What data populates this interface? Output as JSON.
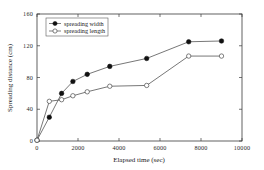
{
  "chart_data": {
    "type": "line",
    "title": "",
    "xlabel": "Elapsed time (sec)",
    "ylabel": "Spreading distance (cm)",
    "xlim": [
      0,
      10000
    ],
    "ylim": [
      0,
      160
    ],
    "xticks": [
      0,
      2000,
      4000,
      6000,
      8000,
      10000
    ],
    "yticks": [
      0,
      40,
      80,
      120,
      160
    ],
    "xtick_labels": [
      "0",
      "2000",
      "4000",
      "6000",
      "8000",
      "10000"
    ],
    "ytick_labels": [
      "0",
      "40",
      "80",
      "120",
      "160"
    ],
    "grid": false,
    "legend_position": "upper-left",
    "series": [
      {
        "name": "spreading width",
        "marker": "filled-circle",
        "x": [
          0,
          600,
          1200,
          1750,
          2450,
          3550,
          5350,
          7400,
          9000
        ],
        "values": [
          1,
          30,
          60,
          75,
          84,
          94,
          104,
          125,
          126
        ]
      },
      {
        "name": "spreading length",
        "marker": "open-circle",
        "x": [
          0,
          600,
          1200,
          1750,
          2450,
          3550,
          5350,
          7400,
          9000
        ],
        "values": [
          1,
          50,
          52,
          57,
          62,
          69,
          70,
          107,
          107
        ]
      }
    ]
  },
  "legend": {
    "entries": [
      {
        "label": "spreading width"
      },
      {
        "label": "spreading length"
      }
    ]
  },
  "colors": {
    "axis": "#3b3b3b",
    "line": "#4a4a4a",
    "filled_marker": "#111111",
    "open_marker_fill": "#ffffff",
    "background": "#ffffff"
  }
}
